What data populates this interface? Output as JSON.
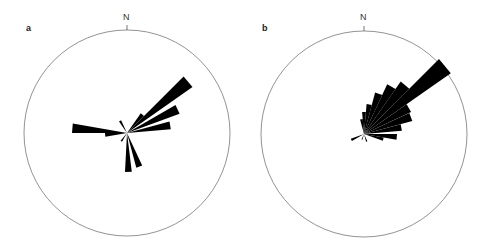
{
  "chart_data": [
    {
      "type": "rose",
      "panel": "a",
      "north_label": "N",
      "center": [
        127,
        133
      ],
      "radius": 103,
      "petal_half_width_deg": 5,
      "petals": [
        {
          "bearing": 50,
          "length": 80
        },
        {
          "bearing": 65,
          "length": 56
        },
        {
          "bearing": 80,
          "length": 44
        },
        {
          "bearing": 275,
          "length": 55
        },
        {
          "bearing": 265,
          "length": 22
        },
        {
          "bearing": 160,
          "length": 36
        },
        {
          "bearing": 178,
          "length": 39
        },
        {
          "bearing": 330,
          "length": 14
        },
        {
          "bearing": 215,
          "length": 10
        },
        {
          "bearing": 40,
          "length": 24
        }
      ]
    },
    {
      "type": "rose",
      "panel": "b",
      "north_label": "N",
      "center": [
        364,
        134
      ],
      "radius": 103,
      "petal_half_width_deg": 5,
      "petals": [
        {
          "bearing": 50,
          "length": 106
        },
        {
          "bearing": 40,
          "length": 64
        },
        {
          "bearing": 30,
          "length": 55
        },
        {
          "bearing": 20,
          "length": 43
        },
        {
          "bearing": 10,
          "length": 30
        },
        {
          "bearing": 0,
          "length": 22
        },
        {
          "bearing": 350,
          "length": 15
        },
        {
          "bearing": 60,
          "length": 52
        },
        {
          "bearing": 70,
          "length": 50
        },
        {
          "bearing": 80,
          "length": 38
        },
        {
          "bearing": 95,
          "length": 33
        },
        {
          "bearing": 105,
          "length": 20
        },
        {
          "bearing": 245,
          "length": 14
        },
        {
          "bearing": 160,
          "length": 8
        },
        {
          "bearing": 200,
          "length": 6
        }
      ]
    }
  ],
  "labels": {
    "panel_a": "a",
    "panel_b": "b",
    "north_a": "N",
    "north_b": "N"
  }
}
